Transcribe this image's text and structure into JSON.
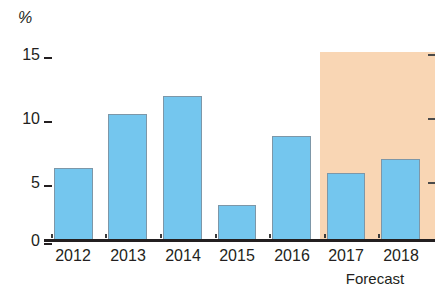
{
  "chart_data": {
    "type": "bar",
    "title": "",
    "subtitle": "",
    "xlabel": "",
    "ylabel": "%",
    "unit_label": "%",
    "categories": [
      "2012",
      "2013",
      "2014",
      "2015",
      "2016",
      "2017",
      "2018"
    ],
    "values": [
      5.8,
      10.2,
      11.6,
      2.8,
      8.4,
      5.4,
      6.5
    ],
    "series": [
      {
        "name": "",
        "values": [
          5.8,
          10.2,
          11.6,
          2.8,
          8.4,
          5.4,
          6.5
        ]
      }
    ],
    "ylim": [
      0,
      15.6
    ],
    "yticks": [
      0,
      5,
      10,
      15
    ],
    "ytick_labels": [
      "0",
      "5",
      "10",
      "15"
    ],
    "grid": false,
    "legend": false,
    "legend_position": "none",
    "bar_color": "#74c6ee",
    "bar_border_color": "#7d97a8",
    "annotations": [
      {
        "label": "Forecast",
        "covers": [
          "2017",
          "2018"
        ],
        "band_color": "#f9d6b4",
        "band_top_value": 15.2
      }
    ]
  },
  "axis": {
    "unit": "%",
    "y_labels": [
      "15",
      "10",
      "5",
      "0"
    ],
    "x_labels": [
      "2012",
      "2013",
      "2014",
      "2015",
      "2016",
      "2017",
      "2018"
    ]
  },
  "forecast": {
    "caption": "Forecast"
  }
}
